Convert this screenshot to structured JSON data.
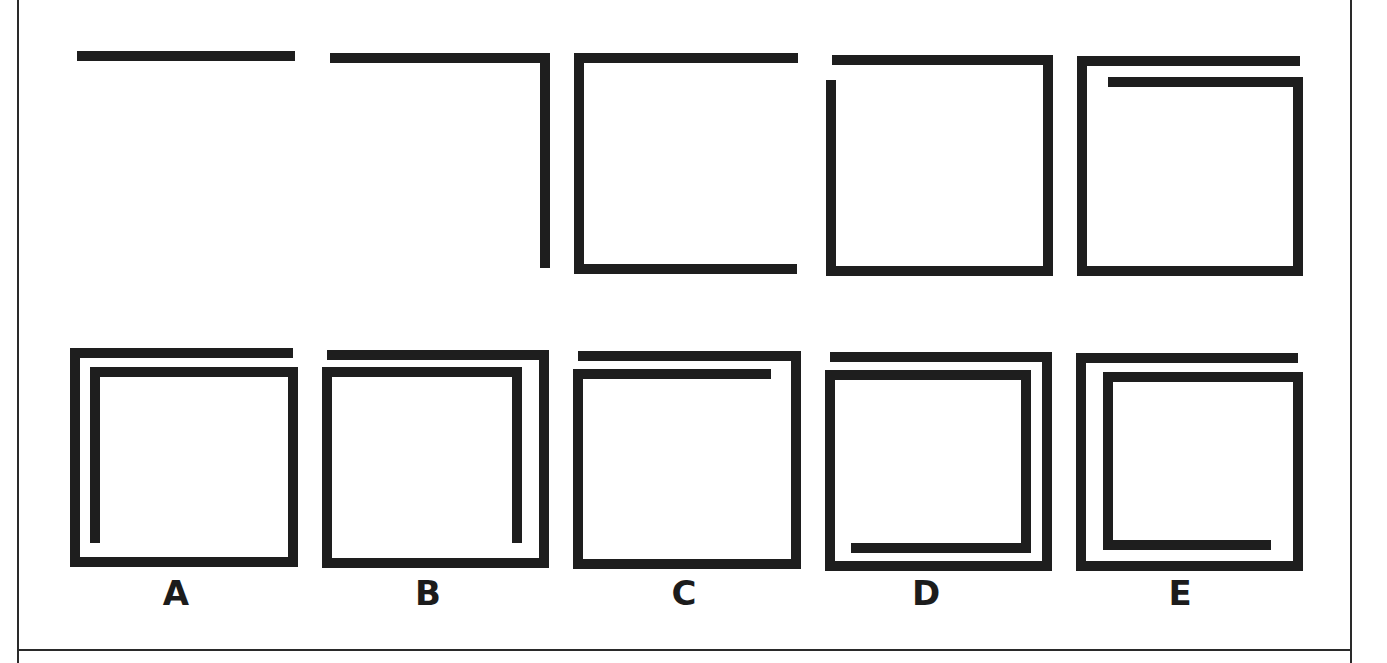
{
  "puzzle": {
    "ink_color": "#1e1e1e",
    "border_color": "#2a2a2a",
    "stroke_width": 10,
    "sequence_row": [
      {
        "name": "sequence-figure-1",
        "segments": [
          {
            "x1": 77,
            "y1": 51,
            "x2": 295,
            "y2": 51
          }
        ]
      },
      {
        "name": "sequence-figure-2",
        "segments": [
          {
            "x1": 330,
            "y1": 53,
            "x2": 550,
            "y2": 53
          },
          {
            "x1": 540,
            "y1": 53,
            "x2": 540,
            "y2": 268
          }
        ]
      },
      {
        "name": "sequence-figure-3",
        "segments": [
          {
            "x1": 574,
            "y1": 53,
            "x2": 798,
            "y2": 53
          },
          {
            "x1": 574,
            "y1": 53,
            "x2": 574,
            "y2": 273
          },
          {
            "x1": 574,
            "y1": 264,
            "x2": 797,
            "y2": 264
          }
        ]
      },
      {
        "name": "sequence-figure-4",
        "segments": [
          {
            "x1": 832,
            "y1": 55,
            "x2": 1053,
            "y2": 55
          },
          {
            "x1": 1043,
            "y1": 55,
            "x2": 1043,
            "y2": 275
          },
          {
            "x1": 826,
            "y1": 266,
            "x2": 1053,
            "y2": 266
          },
          {
            "x1": 826,
            "y1": 80,
            "x2": 826,
            "y2": 275
          }
        ]
      },
      {
        "name": "sequence-figure-5",
        "segments": [
          {
            "x1": 1077,
            "y1": 56,
            "x2": 1300,
            "y2": 56
          },
          {
            "x1": 1077,
            "y1": 56,
            "x2": 1077,
            "y2": 275
          },
          {
            "x1": 1077,
            "y1": 266,
            "x2": 1303,
            "y2": 266
          },
          {
            "x1": 1293,
            "y1": 77,
            "x2": 1293,
            "y2": 275
          },
          {
            "x1": 1108,
            "y1": 77,
            "x2": 1303,
            "y2": 77
          }
        ]
      }
    ],
    "options": [
      {
        "label": "A",
        "label_x": 146,
        "segments": [
          {
            "x1": 70,
            "y1": 348,
            "x2": 293,
            "y2": 348
          },
          {
            "x1": 70,
            "y1": 348,
            "x2": 70,
            "y2": 567
          },
          {
            "x1": 70,
            "y1": 557,
            "x2": 298,
            "y2": 557
          },
          {
            "x1": 288,
            "y1": 367,
            "x2": 288,
            "y2": 567
          },
          {
            "x1": 90,
            "y1": 367,
            "x2": 298,
            "y2": 367
          },
          {
            "x1": 90,
            "y1": 367,
            "x2": 90,
            "y2": 543
          }
        ]
      },
      {
        "label": "B",
        "label_x": 398,
        "segments": [
          {
            "x1": 327,
            "y1": 350,
            "x2": 549,
            "y2": 350
          },
          {
            "x1": 539,
            "y1": 350,
            "x2": 539,
            "y2": 567
          },
          {
            "x1": 322,
            "y1": 558,
            "x2": 549,
            "y2": 558
          },
          {
            "x1": 322,
            "y1": 367,
            "x2": 322,
            "y2": 567
          },
          {
            "x1": 322,
            "y1": 367,
            "x2": 522,
            "y2": 367
          },
          {
            "x1": 512,
            "y1": 367,
            "x2": 512,
            "y2": 543
          }
        ]
      },
      {
        "label": "C",
        "label_x": 654,
        "segments": [
          {
            "x1": 578,
            "y1": 351,
            "x2": 801,
            "y2": 351
          },
          {
            "x1": 791,
            "y1": 351,
            "x2": 791,
            "y2": 569
          },
          {
            "x1": 573,
            "y1": 559,
            "x2": 801,
            "y2": 559
          },
          {
            "x1": 573,
            "y1": 369,
            "x2": 573,
            "y2": 569
          },
          {
            "x1": 573,
            "y1": 369,
            "x2": 771,
            "y2": 369
          }
        ]
      },
      {
        "label": "D",
        "label_x": 896,
        "segments": [
          {
            "x1": 830,
            "y1": 352,
            "x2": 1052,
            "y2": 352
          },
          {
            "x1": 1042,
            "y1": 352,
            "x2": 1042,
            "y2": 570
          },
          {
            "x1": 825,
            "y1": 561,
            "x2": 1052,
            "y2": 561
          },
          {
            "x1": 825,
            "y1": 370,
            "x2": 825,
            "y2": 570
          },
          {
            "x1": 825,
            "y1": 370,
            "x2": 1031,
            "y2": 370
          },
          {
            "x1": 1021,
            "y1": 370,
            "x2": 1021,
            "y2": 552
          },
          {
            "x1": 851,
            "y1": 543,
            "x2": 1031,
            "y2": 543
          }
        ]
      },
      {
        "label": "E",
        "label_x": 1150,
        "segments": [
          {
            "x1": 1076,
            "y1": 353,
            "x2": 1298,
            "y2": 353
          },
          {
            "x1": 1076,
            "y1": 353,
            "x2": 1076,
            "y2": 570
          },
          {
            "x1": 1076,
            "y1": 561,
            "x2": 1303,
            "y2": 561
          },
          {
            "x1": 1293,
            "y1": 372,
            "x2": 1293,
            "y2": 570
          },
          {
            "x1": 1103,
            "y1": 372,
            "x2": 1303,
            "y2": 372
          },
          {
            "x1": 1103,
            "y1": 372,
            "x2": 1103,
            "y2": 549
          },
          {
            "x1": 1103,
            "y1": 540,
            "x2": 1271,
            "y2": 540
          }
        ]
      }
    ]
  }
}
